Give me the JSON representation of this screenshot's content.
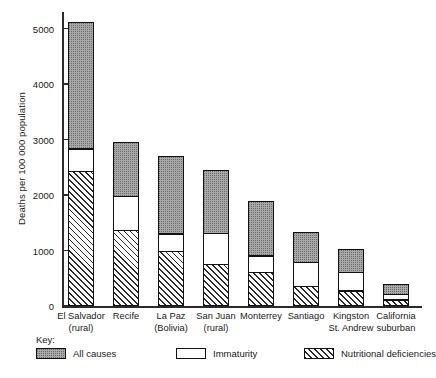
{
  "chart_data": {
    "type": "bar",
    "stacked": true,
    "title": "",
    "xlabel": "",
    "ylabel": "Deaths per 100 000 population",
    "ylim": [
      0,
      5300
    ],
    "yticks": [
      0,
      1000,
      2000,
      3000,
      4000,
      5000
    ],
    "ytick_labels": [
      "0",
      "1000",
      "2000",
      "3000",
      "4000",
      "5000"
    ],
    "grid": false,
    "legend_position": "bottom",
    "legend_title": "Key:",
    "categories": [
      "El Salvador\n(rural)",
      "Recife",
      "La Paz\n(Bolivia)",
      "San Juan\n(rural)",
      "Monterrey",
      "Santiago",
      "Kingston\nSt. Andrew",
      "California\nsuburban"
    ],
    "series": [
      {
        "name": "Nutritional deficiencies",
        "fill": "hatched",
        "color": "#ffffff",
        "values": [
          2400,
          1330,
          950,
          720,
          570,
          320,
          240,
          80
        ]
      },
      {
        "name": "Immaturity",
        "fill": "white",
        "color": "#ffffff",
        "values": [
          400,
          620,
          320,
          560,
          300,
          440,
          330,
          100
        ]
      },
      {
        "name": "All causes",
        "fill": "stippled-gray",
        "color": "#a8a8a8",
        "values": [
          2320,
          1010,
          1430,
          1170,
          1030,
          580,
          450,
          220
        ]
      }
    ],
    "totals": [
      5120,
      2960,
      2700,
      2450,
      1900,
      1340,
      1020,
      400
    ]
  },
  "legend": {
    "title": "Key:",
    "items": [
      {
        "label": "All causes",
        "swatch": "stippled-gray"
      },
      {
        "label": "Immaturity",
        "swatch": "white"
      },
      {
        "label": "Nutritional deficiencies",
        "swatch": "hatched"
      }
    ]
  }
}
